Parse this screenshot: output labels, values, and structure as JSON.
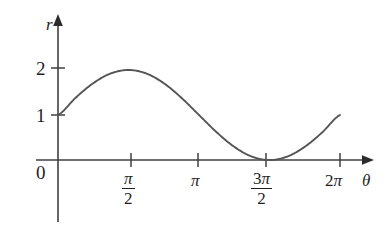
{
  "figure": {
    "background_color": "#ffffff",
    "axis_color": "#404040",
    "curve_color": "#555555",
    "text_color": "#1f1f1f"
  },
  "axes": {
    "y_axis_label": "r",
    "x_axis_label": "θ",
    "origin_label": "0",
    "y_ticks": [
      {
        "label": "1",
        "value": 1
      },
      {
        "label": "2",
        "value": 2
      }
    ],
    "x_ticks": [
      {
        "label": "π/2",
        "kind": "fraction",
        "numerator": "π",
        "coefficient": "",
        "denominator": "2",
        "value": 1.5707963
      },
      {
        "label": "π",
        "kind": "symbol",
        "numerator": "π",
        "coefficient": "",
        "denominator": "",
        "value": 3.1415927
      },
      {
        "label": "3π/2",
        "kind": "fraction",
        "numerator": "π",
        "coefficient": "3",
        "denominator": "2",
        "value": 4.712389
      },
      {
        "label": "2π",
        "kind": "symbol",
        "numerator": "π",
        "coefficient": "2",
        "denominator": "",
        "value": 6.2831853
      }
    ]
  },
  "chart_data": {
    "type": "line",
    "title": "",
    "xlabel": "θ",
    "ylabel": "r",
    "equation": "r = 1 + sin(θ)",
    "grid": false,
    "legend": false,
    "xlim": [
      0,
      6.2831853
    ],
    "ylim": [
      0,
      2
    ],
    "xtick_values": [
      1.5707963,
      3.1415927,
      4.712389,
      6.2831853
    ],
    "xtick_labels": [
      "π/2",
      "π",
      "3π/2",
      "2π"
    ],
    "ytick_values": [
      1,
      2
    ],
    "ytick_labels": [
      "1",
      "2"
    ],
    "series": [
      {
        "name": "r = 1 + sin(θ)",
        "color": "#555555",
        "x": [
          0,
          0.3926991,
          0.7853982,
          1.1780972,
          1.5707963,
          1.9634954,
          2.3561945,
          2.7488936,
          3.1415927,
          3.5342917,
          3.9269908,
          4.3196899,
          4.712389,
          5.1050881,
          5.4977871,
          5.8904862,
          6.2831853
        ],
        "y": [
          1.0,
          1.3826834,
          1.7071068,
          1.9238795,
          2.0,
          1.9238795,
          1.7071068,
          1.3826834,
          1.0,
          0.6173166,
          0.2928932,
          0.0761205,
          0.0,
          0.0761205,
          0.2928932,
          0.6173166,
          1.0
        ]
      }
    ],
    "annotations": [
      {
        "text": "curve starts at (0, 1) on the r-axis"
      },
      {
        "text": "maximum r = 2 at θ = π/2"
      },
      {
        "text": "minimum r = 0 touches the θ-axis at θ = 3π/2"
      },
      {
        "text": "curve ends at r = 1 at θ = 2π"
      }
    ]
  }
}
